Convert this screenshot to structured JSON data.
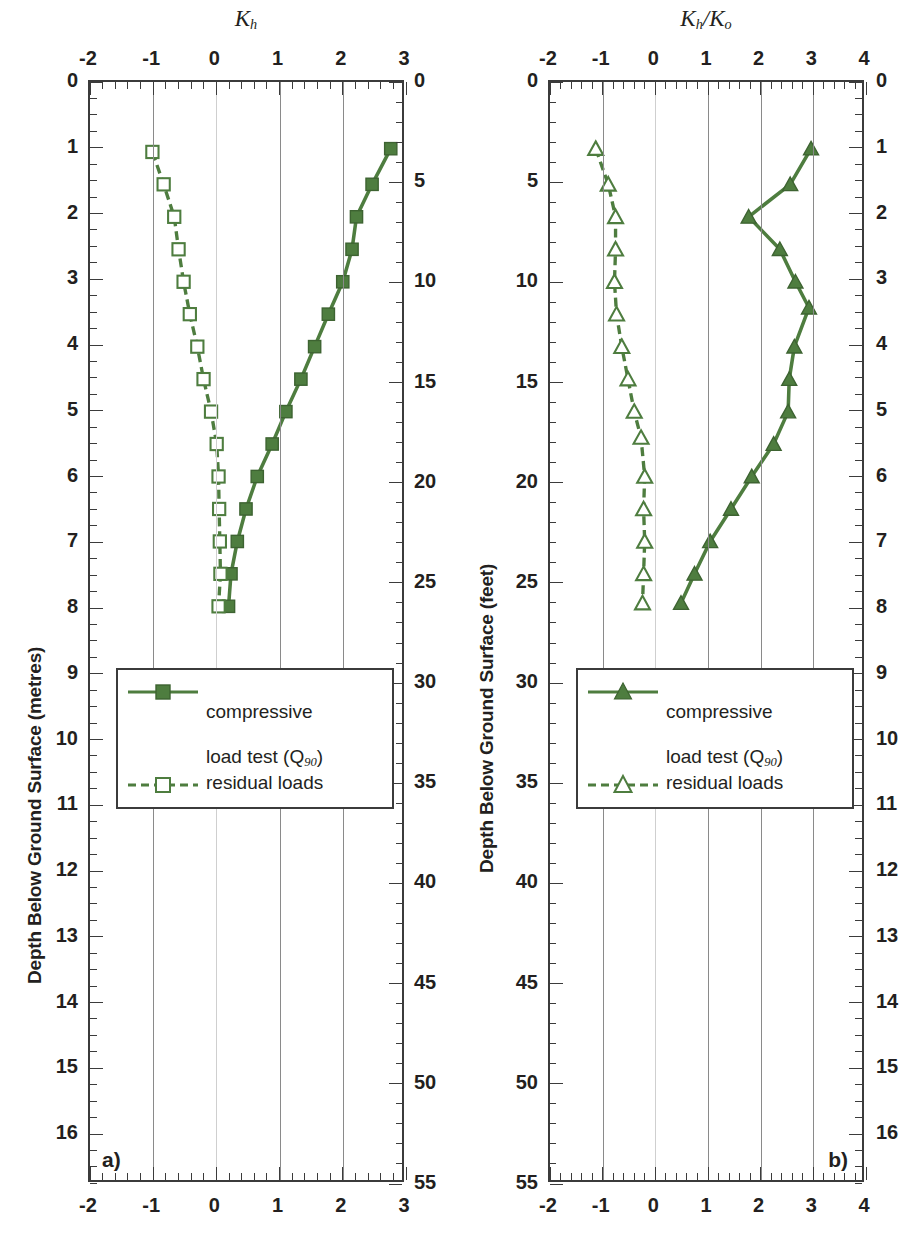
{
  "figure": {
    "width": 924,
    "height": 1247,
    "series_color": "#4e7d3f",
    "axis_color": "#3b3b3b",
    "grid_color": "#8a8a8a"
  },
  "axes": {
    "depth_metres_label": "Depth Below Ground Surface (metres)",
    "depth_feet_label": "Depth Below Ground Surface (feet)",
    "metres_ticks": [
      0,
      1,
      2,
      3,
      4,
      5,
      6,
      7,
      8,
      9,
      10,
      11,
      12,
      13,
      14,
      15,
      16
    ],
    "metres_range": [
      0,
      16.76
    ],
    "feet_ticks": [
      0,
      5,
      10,
      15,
      20,
      25,
      30,
      35,
      40,
      45,
      50,
      55
    ],
    "feet_range": [
      0,
      55
    ]
  },
  "panels": [
    {
      "id": "a",
      "letter": "a)",
      "title": "K",
      "title_sub": "h",
      "title_html": "K<sub>h</sub>",
      "xlabel": "",
      "xticks": [
        -2,
        -1,
        0,
        1,
        2,
        3
      ],
      "xlim": [
        -2,
        3
      ],
      "minor_ticks_per_interval": 5,
      "legend": {
        "items": [
          {
            "label": "compressive\nload test (Q90)",
            "label_line1": "compressive",
            "label_line2": "load test (Q",
            "label_sub": "90",
            "label_close": ")",
            "marker": "filled-square",
            "line": "solid"
          },
          {
            "label": "residual loads",
            "marker": "open-square",
            "line": "dashed"
          }
        ]
      }
    },
    {
      "id": "b",
      "letter": "b)",
      "title": "K",
      "title_sub": "h",
      "title_html": "K<sub>h</sub>/K<sub>o</sub>",
      "xlabel": "",
      "xticks": [
        -2,
        -1,
        0,
        1,
        2,
        3,
        4
      ],
      "xlim": [
        -2,
        4
      ],
      "minor_ticks_per_interval": 5,
      "legend": {
        "items": [
          {
            "label": "compressive\nload test (Q90)",
            "label_line1": "compressive",
            "label_line2": "load test (Q",
            "label_sub": "90",
            "label_close": ")",
            "marker": "filled-triangle",
            "line": "solid"
          },
          {
            "label": "residual loads",
            "marker": "open-triangle",
            "line": "dashed"
          }
        ]
      }
    }
  ],
  "chart_data": [
    {
      "type": "line",
      "panel": "a",
      "title": "Kh",
      "xlabel": "Kh",
      "ylabel": "Depth Below Ground Surface (metres)",
      "ylabel_secondary": "Depth Below Ground Surface (feet)",
      "xlim": [
        -2,
        3
      ],
      "ylim": [
        0,
        16.76
      ],
      "y_inverted": true,
      "grid": true,
      "legend_position": "center-left",
      "series": [
        {
          "name": "compressive load test (Q90)",
          "marker": "filled-square",
          "line": "solid",
          "points": [
            {
              "x": 2.82,
              "depth_m": 0.95
            },
            {
              "x": 2.52,
              "depth_m": 1.5
            },
            {
              "x": 2.27,
              "depth_m": 2.0
            },
            {
              "x": 2.2,
              "depth_m": 2.5
            },
            {
              "x": 2.05,
              "depth_m": 3.0
            },
            {
              "x": 1.82,
              "depth_m": 3.5
            },
            {
              "x": 1.6,
              "depth_m": 4.0
            },
            {
              "x": 1.38,
              "depth_m": 4.5
            },
            {
              "x": 1.14,
              "depth_m": 5.0
            },
            {
              "x": 0.92,
              "depth_m": 5.5
            },
            {
              "x": 0.68,
              "depth_m": 6.0
            },
            {
              "x": 0.5,
              "depth_m": 6.5
            },
            {
              "x": 0.36,
              "depth_m": 7.0
            },
            {
              "x": 0.26,
              "depth_m": 7.5
            },
            {
              "x": 0.22,
              "depth_m": 8.0
            }
          ]
        },
        {
          "name": "residual loads",
          "marker": "open-square",
          "line": "dashed",
          "points": [
            {
              "x": -1.0,
              "depth_m": 1.0
            },
            {
              "x": -0.82,
              "depth_m": 1.5
            },
            {
              "x": -0.65,
              "depth_m": 2.0
            },
            {
              "x": -0.58,
              "depth_m": 2.5
            },
            {
              "x": -0.5,
              "depth_m": 3.0
            },
            {
              "x": -0.4,
              "depth_m": 3.5
            },
            {
              "x": -0.28,
              "depth_m": 4.0
            },
            {
              "x": -0.18,
              "depth_m": 4.5
            },
            {
              "x": -0.06,
              "depth_m": 5.0
            },
            {
              "x": 0.03,
              "depth_m": 5.5
            },
            {
              "x": 0.06,
              "depth_m": 6.0
            },
            {
              "x": 0.07,
              "depth_m": 6.5
            },
            {
              "x": 0.08,
              "depth_m": 7.0
            },
            {
              "x": 0.09,
              "depth_m": 7.5
            },
            {
              "x": 0.06,
              "depth_m": 8.0
            }
          ]
        }
      ]
    },
    {
      "type": "line",
      "panel": "b",
      "title": "Kh/Ko",
      "xlabel": "Kh/Ko",
      "ylabel": "Depth Below Ground Surface (metres)",
      "ylabel_secondary": "Depth Below Ground Surface (feet)",
      "xlim": [
        -2,
        4
      ],
      "ylim": [
        0,
        16.76
      ],
      "y_inverted": true,
      "grid": true,
      "legend_position": "center-left",
      "series": [
        {
          "name": "compressive load test (Q90)",
          "marker": "filled-triangle",
          "line": "solid",
          "points": [
            {
              "x": 3.02,
              "depth_m": 0.95
            },
            {
              "x": 2.62,
              "depth_m": 1.5
            },
            {
              "x": 1.82,
              "depth_m": 2.0
            },
            {
              "x": 2.42,
              "depth_m": 2.5
            },
            {
              "x": 2.72,
              "depth_m": 3.0
            },
            {
              "x": 2.98,
              "depth_m": 3.4
            },
            {
              "x": 2.7,
              "depth_m": 4.0
            },
            {
              "x": 2.6,
              "depth_m": 4.5
            },
            {
              "x": 2.58,
              "depth_m": 5.0
            },
            {
              "x": 2.3,
              "depth_m": 5.5
            },
            {
              "x": 1.88,
              "depth_m": 6.0
            },
            {
              "x": 1.48,
              "depth_m": 6.5
            },
            {
              "x": 1.08,
              "depth_m": 7.0
            },
            {
              "x": 0.78,
              "depth_m": 7.5
            },
            {
              "x": 0.52,
              "depth_m": 7.95
            }
          ]
        },
        {
          "name": "residual loads",
          "marker": "open-triangle",
          "line": "dashed",
          "points": [
            {
              "x": -1.12,
              "depth_m": 0.95
            },
            {
              "x": -0.88,
              "depth_m": 1.5
            },
            {
              "x": -0.74,
              "depth_m": 2.0
            },
            {
              "x": -0.74,
              "depth_m": 2.5
            },
            {
              "x": -0.76,
              "depth_m": 3.0
            },
            {
              "x": -0.72,
              "depth_m": 3.5
            },
            {
              "x": -0.62,
              "depth_m": 4.0
            },
            {
              "x": -0.5,
              "depth_m": 4.5
            },
            {
              "x": -0.38,
              "depth_m": 5.0
            },
            {
              "x": -0.25,
              "depth_m": 5.4
            },
            {
              "x": -0.18,
              "depth_m": 6.0
            },
            {
              "x": -0.2,
              "depth_m": 6.5
            },
            {
              "x": -0.18,
              "depth_m": 7.0
            },
            {
              "x": -0.2,
              "depth_m": 7.5
            },
            {
              "x": -0.22,
              "depth_m": 7.95
            }
          ]
        }
      ]
    }
  ]
}
